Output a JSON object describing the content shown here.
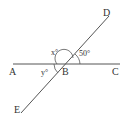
{
  "diagram": {
    "points": {
      "A": "A",
      "B": "B",
      "C": "C",
      "D": "D",
      "E": "E"
    },
    "angles": {
      "x": "x°",
      "fifty": "50°",
      "y": "y°"
    },
    "colors": {
      "line": "#555555",
      "text": "#333333"
    }
  }
}
